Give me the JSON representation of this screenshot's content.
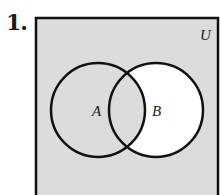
{
  "problem": {
    "number": "1."
  },
  "diagram": {
    "universe_label": "U",
    "sets": [
      {
        "label": "A",
        "cx": 98,
        "cy": 110,
        "r": 47
      },
      {
        "label": "B",
        "cx": 156,
        "cy": 110,
        "r": 47
      }
    ],
    "shaded_region": "A ∪ B'",
    "colors": {
      "shade": "#dcdcdc",
      "unshaded": "#ffffff",
      "stroke": "#111111"
    }
  }
}
